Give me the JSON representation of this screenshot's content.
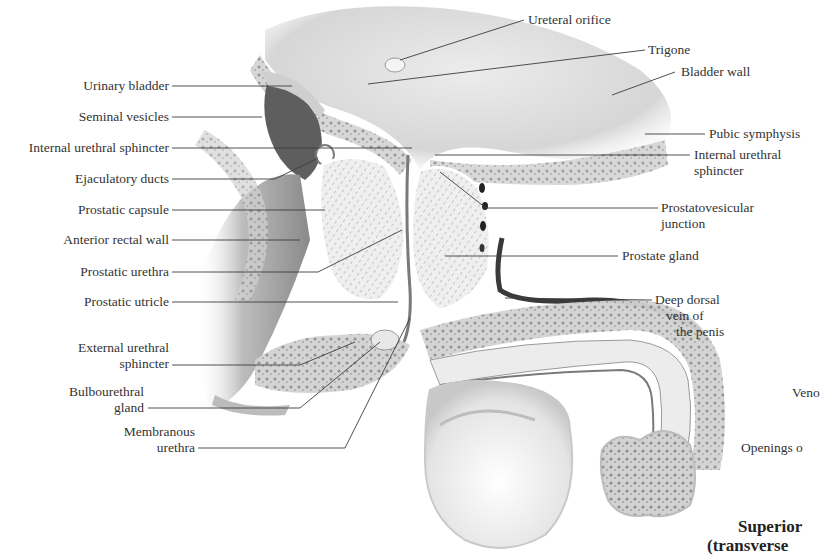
{
  "figure": {
    "type": "labeled anatomical illustration"
  },
  "labels_left": [
    {
      "id": "urinary-bladder",
      "text": "Urinary bladder"
    },
    {
      "id": "seminal-vesicles",
      "text": "Seminal vesicles"
    },
    {
      "id": "internal-urethral-sphincter-left",
      "text": "Internal urethral sphincter"
    },
    {
      "id": "ejaculatory-ducts",
      "text": "Ejaculatory ducts"
    },
    {
      "id": "prostatic-capsule",
      "text": "Prostatic capsule"
    },
    {
      "id": "anterior-rectal-wall",
      "text": "Anterior rectal wall"
    },
    {
      "id": "prostatic-urethra",
      "text": "Prostatic urethra"
    },
    {
      "id": "prostatic-utricle",
      "text": "Prostatic utricle"
    },
    {
      "id": "external-urethral-sphincter",
      "line1": "External urethral",
      "line2": "sphincter"
    },
    {
      "id": "bulbourethral-gland",
      "line1": "Bulbourethral",
      "line2": "gland"
    },
    {
      "id": "membranous-urethra",
      "line1": "Membranous",
      "line2": "urethra"
    }
  ],
  "labels_right": [
    {
      "id": "ureteral-orifice",
      "text": "Ureteral orifice"
    },
    {
      "id": "trigone",
      "text": "Trigone"
    },
    {
      "id": "bladder-wall",
      "text": "Bladder wall"
    },
    {
      "id": "pubic-symphysis",
      "text": "Pubic symphysis"
    },
    {
      "id": "internal-urethral-sphincter-right",
      "line1": "Internal urethral",
      "line2": "sphincter"
    },
    {
      "id": "prostatovesicular-junction",
      "line1": "Prostatovesicular",
      "line2": "junction"
    },
    {
      "id": "prostate-gland",
      "text": "Prostate gland"
    },
    {
      "id": "deep-dorsal-vein",
      "line1": "Deep dorsal",
      "line2": "vein of",
      "line3": "the penis"
    }
  ],
  "labels_cropped": [
    {
      "id": "veno-cropped",
      "text": "Veno"
    },
    {
      "id": "openings-cropped",
      "text": "Openings o"
    }
  ],
  "inset_title": {
    "line1": "Superior",
    "line2": "(transverse"
  },
  "colors": {
    "background": "#ffffff",
    "tissue_light": "#e6e6e6",
    "tissue_mid": "#c8c8c8",
    "tissue_dark": "#6a6a6a",
    "vein": "#3a3a3a",
    "leader_line": "#3c3c3c",
    "label_text": "#333333"
  }
}
